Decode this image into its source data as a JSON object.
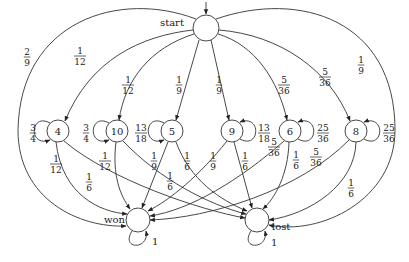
{
  "diagram": {
    "type": "markov-chain",
    "nodes": [
      {
        "id": "start",
        "label": "",
        "tag": "start",
        "x": 206,
        "y": 28,
        "r": 13
      },
      {
        "id": "n4",
        "label": "4",
        "x": 58,
        "y": 131,
        "r": 11
      },
      {
        "id": "n10",
        "label": "10",
        "x": 117,
        "y": 131,
        "r": 11
      },
      {
        "id": "n5",
        "label": "5",
        "x": 172,
        "y": 131,
        "r": 11
      },
      {
        "id": "n9",
        "label": "9",
        "x": 232,
        "y": 131,
        "r": 11
      },
      {
        "id": "n6",
        "label": "6",
        "x": 290,
        "y": 131,
        "r": 11
      },
      {
        "id": "n8",
        "label": "8",
        "x": 356,
        "y": 131,
        "r": 11
      },
      {
        "id": "won",
        "label": "",
        "tag": "won",
        "x": 138,
        "y": 220,
        "r": 12
      },
      {
        "id": "lost",
        "label": "",
        "tag": "lost",
        "x": 257,
        "y": 220,
        "r": 12
      }
    ],
    "labels": {
      "start": "start",
      "won": "won",
      "lost": "lost"
    },
    "edges": [
      {
        "from": "start",
        "to": "won",
        "prob": {
          "num": "2",
          "den": "9"
        }
      },
      {
        "from": "start",
        "to": "lost",
        "prob": {
          "num": "1",
          "den": "9"
        }
      },
      {
        "from": "start",
        "to": "n4",
        "prob": {
          "num": "1",
          "den": "12"
        }
      },
      {
        "from": "start",
        "to": "n10",
        "prob": {
          "num": "1",
          "den": "12"
        }
      },
      {
        "from": "start",
        "to": "n5",
        "prob": {
          "num": "1",
          "den": "9"
        }
      },
      {
        "from": "start",
        "to": "n9",
        "prob": {
          "num": "1",
          "den": "9"
        }
      },
      {
        "from": "start",
        "to": "n6",
        "prob": {
          "num": "5",
          "den": "36"
        }
      },
      {
        "from": "start",
        "to": "n8",
        "prob": {
          "num": "5",
          "den": "36"
        }
      },
      {
        "from": "n4",
        "to": "n4",
        "prob": {
          "num": "3",
          "den": "4"
        }
      },
      {
        "from": "n10",
        "to": "n10",
        "prob": {
          "num": "3",
          "den": "4"
        }
      },
      {
        "from": "n5",
        "to": "n5",
        "prob": {
          "num": "13",
          "den": "18"
        }
      },
      {
        "from": "n9",
        "to": "n9",
        "prob": {
          "num": "13",
          "den": "18"
        }
      },
      {
        "from": "n6",
        "to": "n6",
        "prob": {
          "num": "25",
          "den": "36"
        }
      },
      {
        "from": "n8",
        "to": "n8",
        "prob": {
          "num": "25",
          "den": "36"
        }
      },
      {
        "from": "n4",
        "to": "won",
        "prob": {
          "num": "1",
          "den": "12"
        }
      },
      {
        "from": "n4",
        "to": "lost",
        "prob": {
          "num": "1",
          "den": "6"
        }
      },
      {
        "from": "n10",
        "to": "won",
        "prob": {
          "num": "1",
          "den": "12"
        }
      },
      {
        "from": "n10",
        "to": "lost",
        "prob": {
          "num": "1",
          "den": "6"
        }
      },
      {
        "from": "n5",
        "to": "won",
        "prob": {
          "num": "1",
          "den": "9"
        }
      },
      {
        "from": "n5",
        "to": "lost",
        "prob": {
          "num": "1",
          "den": "6"
        }
      },
      {
        "from": "n9",
        "to": "won",
        "prob": {
          "num": "1",
          "den": "9"
        }
      },
      {
        "from": "n9",
        "to": "lost",
        "prob": {
          "num": "1",
          "den": "6"
        }
      },
      {
        "from": "n6",
        "to": "won",
        "prob": {
          "num": "5",
          "den": "36"
        }
      },
      {
        "from": "n6",
        "to": "lost",
        "prob": {
          "num": "1",
          "den": "6"
        }
      },
      {
        "from": "n8",
        "to": "won",
        "prob": {
          "num": "5",
          "den": "36"
        }
      },
      {
        "from": "n8",
        "to": "lost",
        "prob": {
          "num": "1",
          "den": "6"
        }
      },
      {
        "from": "won",
        "to": "won",
        "prob": {
          "num": "1",
          "den": ""
        }
      },
      {
        "from": "lost",
        "to": "lost",
        "prob": {
          "num": "1",
          "den": ""
        }
      }
    ],
    "fractions": {
      "f_start_won": {
        "num": "2",
        "den": "9"
      },
      "f_start_4": {
        "num": "1",
        "den": "12"
      },
      "f_start_10": {
        "num": "1",
        "den": "12"
      },
      "f_start_5": {
        "num": "1",
        "den": "9"
      },
      "f_start_9": {
        "num": "1",
        "den": "9"
      },
      "f_start_6": {
        "num": "5",
        "den": "36"
      },
      "f_start_8": {
        "num": "5",
        "den": "36"
      },
      "f_start_lost": {
        "num": "1",
        "den": "9"
      },
      "f_4_self": {
        "num": "3",
        "den": "4"
      },
      "f_10_self": {
        "num": "3",
        "den": "4"
      },
      "f_5_self": {
        "num": "13",
        "den": "18"
      },
      "f_9_self": {
        "num": "13",
        "den": "18"
      },
      "f_6_self": {
        "num": "25",
        "den": "36"
      },
      "f_8_self": {
        "num": "25",
        "den": "36"
      },
      "f_4_won": {
        "num": "1",
        "den": "12"
      },
      "f_4_lost": {
        "num": "1",
        "den": "6"
      },
      "f_10_won": {
        "num": "1",
        "den": "12"
      },
      "f_10_lost": {
        "num": "1",
        "den": "6"
      },
      "f_5_won": {
        "num": "1",
        "den": "9"
      },
      "f_5_lost": {
        "num": "1",
        "den": "6"
      },
      "f_9_won": {
        "num": "1",
        "den": "9"
      },
      "f_9_lost": {
        "num": "1",
        "den": "6"
      },
      "f_6_won": {
        "num": "5",
        "den": "36"
      },
      "f_6_lost": {
        "num": "1",
        "den": "6"
      },
      "f_8_won": {
        "num": "5",
        "den": "36"
      },
      "f_8_lost": {
        "num": "1",
        "den": "6"
      }
    },
    "absorbing_self_loop_label": "1"
  }
}
